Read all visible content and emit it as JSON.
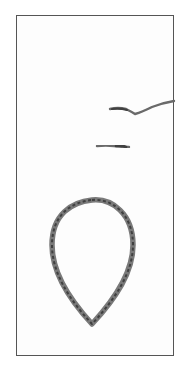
{
  "figure": {
    "description": "Scanned specimen image: a braided fiber loop with two small fiber fragments inside a rectangular frame",
    "colors": {
      "background": "#ffffff",
      "frame": "#555555",
      "fiber": "#6a6a6a",
      "fiber_dark": "#3f3f3f"
    },
    "elements": [
      {
        "name": "fiber-fragment-upper",
        "shape": "wavy strand"
      },
      {
        "name": "fiber-fragment-lower",
        "shape": "short strand"
      },
      {
        "name": "braided-loop",
        "shape": "teardrop loop"
      }
    ]
  }
}
